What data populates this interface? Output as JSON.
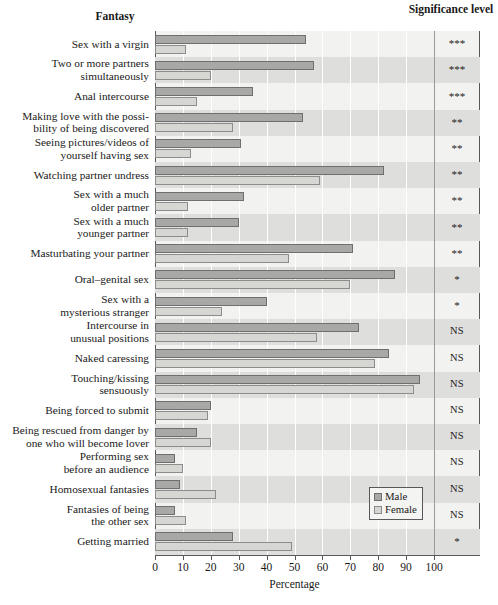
{
  "headers": {
    "fantasy": "Fantasy",
    "significance": "Significance\nlevel"
  },
  "legend": {
    "male": "Male",
    "female": "Female"
  },
  "colors": {
    "male_fill": "#a8a8a6",
    "male_edge": "#6f6f6f",
    "female_fill": "#d6d6d2",
    "female_edge": "#8c8c8c",
    "panel": "#f2f2f0",
    "band": "#dededc",
    "axis": "#58585a"
  },
  "chart_data": {
    "type": "bar",
    "orientation": "horizontal",
    "title": "",
    "xlabel": "Percentage",
    "ylabel": "",
    "xlim": [
      0,
      100
    ],
    "xticks": [
      0,
      10,
      20,
      30,
      40,
      50,
      60,
      70,
      80,
      90,
      100
    ],
    "grid": true,
    "legend_position": "bottom-right",
    "categories": [
      "Sex with a virgin",
      "Two or more partners\nsimultaneously",
      "Anal intercourse",
      "Making love with the possi-\nbility of being discovered",
      "Seeing pictures/videos of\nyourself having sex",
      "Watching partner undress",
      "Sex with a much\nolder partner",
      "Sex with a much\nyounger partner",
      "Masturbating your partner",
      "Oral–genital sex",
      "Sex with a\nmysterious stranger",
      "Intercourse in\nunusual positions",
      "Naked caressing",
      "Touching/kissing\nsensuously",
      "Being forced to submit",
      "Being rescued from danger by\none who will become lover",
      "Performing sex\nbefore an audience",
      "Homosexual fantasies",
      "Fantasies of being\nthe other sex",
      "Getting married"
    ],
    "series": [
      {
        "name": "Male",
        "values": [
          54,
          57,
          35,
          53,
          31,
          82,
          32,
          30,
          71,
          86,
          40,
          73,
          84,
          95,
          20,
          15,
          7,
          9,
          7,
          28
        ]
      },
      {
        "name": "Female",
        "values": [
          11,
          20,
          15,
          28,
          13,
          59,
          12,
          12,
          48,
          70,
          24,
          58,
          79,
          93,
          19,
          20,
          10,
          22,
          11,
          49
        ]
      }
    ],
    "significance": [
      "***",
      "***",
      "***",
      "**",
      "**",
      "**",
      "**",
      "**",
      "**",
      "*",
      "*",
      "NS",
      "NS",
      "NS",
      "NS",
      "NS",
      "NS",
      "NS",
      "NS",
      "*"
    ]
  }
}
